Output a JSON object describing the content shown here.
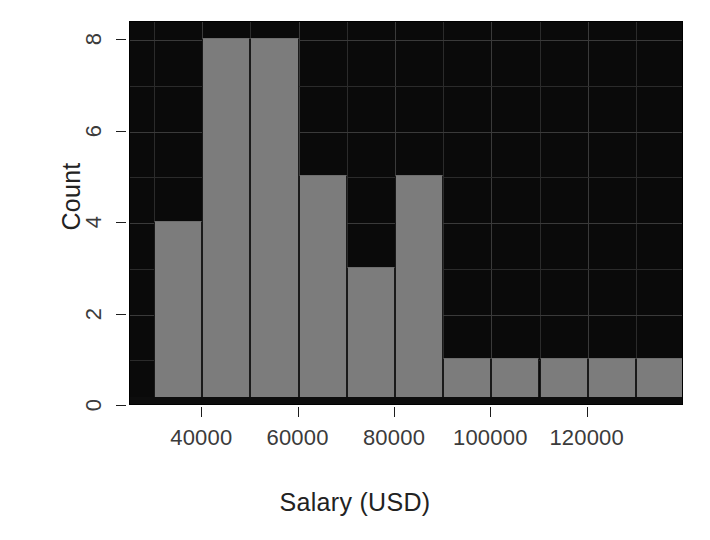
{
  "chart_data": {
    "type": "bar",
    "title": "",
    "subtitle": "",
    "xlabel": "Salary (USD)",
    "ylabel": "Count",
    "categories": [
      "30000-40000",
      "40000-50000",
      "50000-60000",
      "60000-70000",
      "70000-80000",
      "80000-90000",
      "90000-100000",
      "100000-110000",
      "110000-120000",
      "120000-130000",
      "130000-140000"
    ],
    "bin_starts": [
      30000,
      40000,
      50000,
      60000,
      70000,
      80000,
      90000,
      100000,
      110000,
      120000,
      130000
    ],
    "bin_width": 10000,
    "values": [
      4,
      8,
      8,
      5,
      3,
      5,
      1,
      1,
      1,
      1,
      1
    ],
    "xlim": [
      25000,
      140000
    ],
    "ylim": [
      0,
      8.4
    ],
    "xticks": [
      40000,
      60000,
      80000,
      100000,
      120000
    ],
    "xtick_labels": [
      "40000",
      "60000",
      "80000",
      "100000",
      "120000"
    ],
    "yticks": [
      0,
      2,
      4,
      6,
      8
    ],
    "ytick_labels": [
      "0",
      "2",
      "4",
      "6",
      "8"
    ],
    "grid": true,
    "legend": null,
    "colors": {
      "bar_fill": "#7c7c7c",
      "panel_background": "#0a0a0a",
      "grid_line": "#2b2b2b",
      "axis_text": "#3b3b3b",
      "title_text": "#222222"
    }
  }
}
